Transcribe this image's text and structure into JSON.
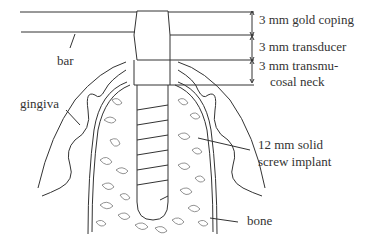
{
  "diagram": {
    "labels": {
      "gold_coping": "3 mm gold coping",
      "transducer": "3 mm transducer",
      "neck_line1": "3 mm transmu-",
      "neck_line2": "cosal neck",
      "bar": "bar",
      "gingiva": "gingiva",
      "implant_line1": "12 mm solid",
      "implant_line2": "screw implant",
      "bone": "bone"
    },
    "colors": {
      "stroke": "#333333",
      "background": "#ffffff"
    }
  }
}
